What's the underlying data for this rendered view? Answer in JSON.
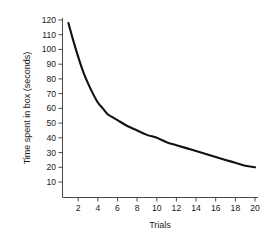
{
  "chart_data": {
    "type": "line",
    "title": "",
    "subtitle": "",
    "xlabel": "Trials",
    "ylabel": "Time spent in box (seconds)",
    "xlim": [
      1,
      20
    ],
    "ylim": [
      0,
      125
    ],
    "grid": false,
    "legend": null,
    "legend_position": "none",
    "annotations": [],
    "x_ticks": [
      2,
      4,
      6,
      8,
      10,
      12,
      14,
      16,
      18,
      20
    ],
    "x_tick_labels": [
      "2",
      "4",
      "6",
      "8",
      "10",
      "12",
      "14",
      "16",
      "18",
      "20"
    ],
    "y_ticks": [
      10,
      20,
      30,
      40,
      50,
      60,
      70,
      80,
      90,
      100,
      110,
      120
    ],
    "y_tick_labels": [
      "10",
      "20",
      "30",
      "40",
      "50",
      "60",
      "70",
      "80",
      "90",
      "100",
      "110",
      "120"
    ],
    "series": [
      {
        "name": "Time spent in box",
        "color": "#111111",
        "x": [
          1,
          1.5,
          2,
          2.5,
          3,
          3.5,
          4,
          4.5,
          5,
          5.5,
          6,
          7,
          8,
          9,
          10,
          11,
          12,
          13,
          14,
          15,
          16,
          17,
          18,
          19,
          20
        ],
        "values": [
          118,
          106,
          95,
          85,
          77,
          70,
          64,
          60,
          56,
          54,
          52,
          48,
          45,
          42,
          40,
          37,
          35,
          33,
          31,
          29,
          27,
          25,
          23,
          21,
          20
        ]
      }
    ],
    "x": [
      1,
      1.5,
      2,
      2.5,
      3,
      3.5,
      4,
      4.5,
      5,
      5.5,
      6,
      7,
      8,
      9,
      10,
      11,
      12,
      13,
      14,
      15,
      16,
      17,
      18,
      19,
      20
    ],
    "values": [
      118,
      106,
      95,
      85,
      77,
      70,
      64,
      60,
      56,
      54,
      52,
      48,
      45,
      42,
      40,
      37,
      35,
      33,
      31,
      29,
      27,
      25,
      23,
      21,
      20
    ]
  },
  "colors": {
    "line": "#111111",
    "axis": "#4a4a4a",
    "text": "#1a1a1a",
    "background": "#ffffff"
  }
}
